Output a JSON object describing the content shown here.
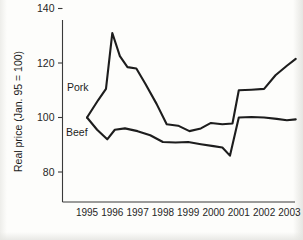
{
  "chart_data": {
    "type": "line",
    "title": "",
    "xlabel": "",
    "ylabel": "Real price (Jan. 95 = 100)",
    "grid": false,
    "legend_position": "inline-annotation",
    "xlim": [
      1995,
      2003.5
    ],
    "ylim": [
      70,
      145
    ],
    "yticks": [
      80,
      100,
      120,
      140
    ],
    "ytick_labels": [
      "80",
      "100",
      "120",
      "140"
    ],
    "categories": [
      "1995",
      "1996",
      "1997",
      "1998",
      "1999",
      "2000",
      "2001",
      "2002",
      "2003"
    ],
    "xticks": [
      1995,
      1996,
      1997,
      1998,
      1999,
      2000,
      2001,
      2002,
      2003
    ],
    "series": [
      {
        "name": "Pork",
        "color": "#1d1d1d",
        "x": [
          1995.0,
          1995.45,
          1995.75,
          1996.0,
          1996.3,
          1996.6,
          1996.95,
          1997.3,
          1997.75,
          1998.15,
          1998.6,
          1999.05,
          1999.5,
          1999.9,
          2000.35,
          2000.75,
          2001.0,
          2001.5,
          2002.0,
          2002.45,
          2002.9,
          2003.25
        ],
        "values": [
          100.0,
          106.5,
          110.5,
          131.0,
          122.5,
          118.5,
          118.0,
          112.5,
          105.0,
          97.5,
          97.0,
          95.0,
          96.0,
          98.0,
          97.5,
          97.8,
          110.0,
          110.2,
          110.5,
          115.5,
          119.0,
          121.5
        ]
      },
      {
        "name": "Beef",
        "color": "#1d1d1d",
        "x": [
          1995.0,
          1995.4,
          1995.8,
          1996.1,
          1996.5,
          1997.0,
          1997.5,
          1998.0,
          1998.5,
          1999.0,
          1999.5,
          2000.0,
          2000.35,
          2000.65,
          2001.0,
          2001.5,
          2002.0,
          2002.5,
          2002.9,
          2003.25
        ],
        "values": [
          100.0,
          95.5,
          92.0,
          95.5,
          96.0,
          95.0,
          93.5,
          91.0,
          90.8,
          91.0,
          90.2,
          89.5,
          89.0,
          86.0,
          100.0,
          100.2,
          100.0,
          99.5,
          99.0,
          99.3
        ]
      }
    ],
    "annotations": [
      {
        "text": "Pork",
        "x_px": 67,
        "y_px": 91
      },
      {
        "text": "Beef",
        "x_px": 66,
        "y_px": 136
      }
    ]
  }
}
